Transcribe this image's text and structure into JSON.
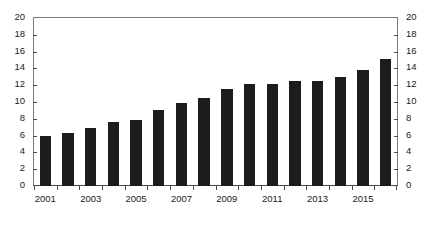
{
  "chart_data": {
    "type": "bar",
    "title": "",
    "subtitle": "",
    "xlabel": "",
    "ylabel": "",
    "ylim": [
      0,
      20
    ],
    "ytick_step": 2,
    "yticks": [
      "0",
      "2",
      "4",
      "6",
      "8",
      "10",
      "12",
      "14",
      "16",
      "18",
      "20"
    ],
    "dual_y_axis": true,
    "grid": false,
    "legend": null,
    "bar_color": "#1c1c1c",
    "axis_color": "#4a4a4a",
    "categories": [
      "2001",
      "2002",
      "2003",
      "2004",
      "2005",
      "2006",
      "2007",
      "2008",
      "2009",
      "2010",
      "2011",
      "2012",
      "2013",
      "2014",
      "2015",
      "2016"
    ],
    "xtick_labels_shown": [
      "2001",
      "2003",
      "2005",
      "2007",
      "2009",
      "2011",
      "2013",
      "2015"
    ],
    "values": [
      6.0,
      6.3,
      6.9,
      7.6,
      7.9,
      9.1,
      9.9,
      10.5,
      11.5,
      12.1,
      12.2,
      12.5,
      12.5,
      13.0,
      13.8,
      15.1
    ],
    "series": [
      {
        "name": "series-1",
        "values": [
          6.0,
          6.3,
          6.9,
          7.6,
          7.9,
          9.1,
          9.9,
          10.5,
          11.5,
          12.1,
          12.2,
          12.5,
          12.5,
          13.0,
          13.8,
          15.1
        ]
      }
    ]
  },
  "caption": ""
}
